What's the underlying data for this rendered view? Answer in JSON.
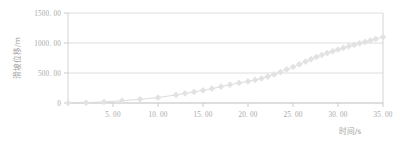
{
  "chart_data": {
    "type": "line",
    "title": "",
    "subtitle": "",
    "xlabel": "时间/s",
    "ylabel": "滑坡位移/m",
    "xlim": [
      0,
      35
    ],
    "ylim": [
      0,
      1500
    ],
    "grid": true,
    "grid_axis": "y",
    "legend": "none",
    "marker": "diamond",
    "marker_color": "#e2e2e2",
    "line_color": "#dcdcdc",
    "xticks": [
      0,
      5,
      10,
      15,
      20,
      25,
      30,
      35
    ],
    "xtick_labels": [
      "0",
      "5. 00",
      "10. 00",
      "15. 00",
      "20. 00",
      "25. 00",
      "30. 00",
      "35. 00"
    ],
    "yticks": [
      0,
      500,
      1000,
      1500
    ],
    "ytick_labels": [
      "0",
      "500. 00",
      "1000. 00",
      "1500. 00"
    ],
    "series": [
      {
        "name": "滑坡位移",
        "x": [
          0.0,
          2.0,
          4.0,
          6.0,
          8.0,
          10.0,
          12.0,
          13.0,
          14.0,
          15.0,
          16.0,
          17.0,
          18.0,
          19.0,
          20.0,
          20.8,
          21.5,
          22.2,
          22.9,
          23.6,
          24.3,
          25.0,
          25.7,
          26.4,
          27.0,
          27.6,
          28.2,
          28.8,
          29.4,
          30.0,
          30.6,
          31.2,
          31.8,
          32.4,
          33.0,
          33.6,
          34.2,
          35.0
        ],
        "y": [
          0,
          6,
          18,
          38,
          62,
          90,
          135,
          160,
          185,
          210,
          240,
          272,
          305,
          335,
          360,
          385,
          410,
          440,
          475,
          515,
          560,
          600,
          645,
          690,
          730,
          768,
          800,
          832,
          862,
          890,
          918,
          945,
          970,
          995,
          1018,
          1042,
          1068,
          1100
        ]
      }
    ]
  },
  "layout": {
    "plot_left": 68,
    "plot_right": 383,
    "plot_top": 13,
    "plot_bottom": 103
  }
}
